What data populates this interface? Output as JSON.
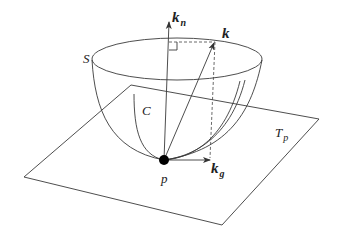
{
  "figure": {
    "labels": {
      "surface": "S",
      "curve": "C",
      "point": "p",
      "tangent_plane": "T",
      "tangent_plane_sub": "p",
      "curvature_vector": "k",
      "normal_curvature": "k",
      "normal_curvature_sub": "n",
      "geodesic_curvature": "k",
      "geodesic_curvature_sub": "g"
    },
    "colors": {
      "line": "#3a3a3a",
      "point": "#000000",
      "background": "#ffffff"
    }
  }
}
